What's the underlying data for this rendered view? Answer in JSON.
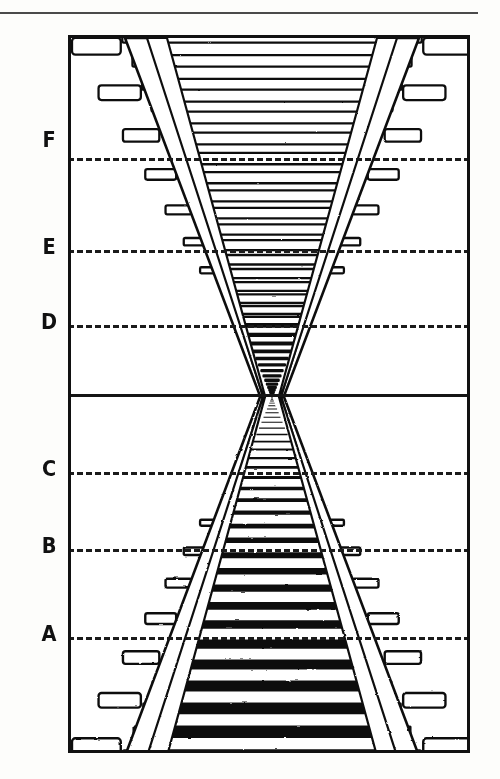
{
  "figure": {
    "ink_color": "#111111",
    "paper_color": "#ffffff"
  },
  "frame": {
    "x": 68,
    "y": 35,
    "width": 402,
    "height": 718,
    "border_px": 3
  },
  "top_rule": {
    "present": true,
    "y": 12,
    "width": 478
  },
  "horizon": {
    "label": "horizon",
    "y": 394,
    "style": "solid",
    "vanishing_point_x": 258,
    "vanishing_point_y": 393
  },
  "depth_lines": [
    {
      "label": "F",
      "y": 158,
      "style": "dashed",
      "half": "upper"
    },
    {
      "label": "E",
      "y": 250,
      "style": "dashed",
      "half": "upper"
    },
    {
      "label": "D",
      "y": 325,
      "style": "dashed",
      "half": "upper"
    },
    {
      "label": "C",
      "y": 472,
      "style": "dashed",
      "half": "lower"
    },
    {
      "label": "B",
      "y": 549,
      "style": "dashed",
      "half": "lower"
    },
    {
      "label": "A",
      "y": 637,
      "style": "dashed",
      "half": "lower"
    }
  ],
  "labels": {
    "F": "F",
    "E": "E",
    "D": "D",
    "C": "C",
    "B": "B",
    "A": "A"
  },
  "tracks": [
    {
      "name": "lower-track",
      "orientation": "upright",
      "render": "solid-black",
      "near_edge": "bottom",
      "sleeper_count": 34
    },
    {
      "name": "upper-track",
      "orientation": "inverted",
      "render": "outline",
      "near_edge": "top",
      "sleeper_count": 34
    }
  ],
  "chart_data": {
    "type": "line",
    "xlabel": "",
    "ylabel": "depth reference",
    "categories": [
      "A",
      "B",
      "C",
      "horizon",
      "D",
      "E",
      "F"
    ],
    "values": [
      637,
      549,
      472,
      394,
      325,
      250,
      158
    ],
    "ylim": [
      35,
      753
    ],
    "grid": true,
    "legend": "none",
    "annotations": [
      "vanishing point at x=258, y=393",
      "solid horizon line at y=394",
      "dashed depth lines A,B,C below horizon and D,E,F above horizon"
    ]
  }
}
